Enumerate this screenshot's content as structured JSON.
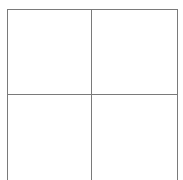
{
  "diagram": {
    "type": "grid",
    "rows": 2,
    "columns": 2,
    "line_color": "#7a7a7a",
    "background": "#ffffff",
    "cells": [
      {
        "row": 1,
        "col": 1,
        "label": ""
      },
      {
        "row": 1,
        "col": 2,
        "label": ""
      },
      {
        "row": 2,
        "col": 1,
        "label": ""
      },
      {
        "row": 2,
        "col": 2,
        "label": ""
      }
    ]
  }
}
